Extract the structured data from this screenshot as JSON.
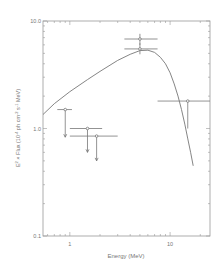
{
  "chart_data": {
    "type": "scatter",
    "title": "",
    "xlabel": "Energy (MeV)",
    "ylabel": "E² × Flux (10⁻⁴ ph cm⁻² s⁻¹ MeV)",
    "ylabel_parts": {
      "pre": "E",
      "sup1": "2",
      "mid": " × Flux (10",
      "sup2": "-4",
      "mid2": " ph cm",
      "sup3": "-2",
      "mid3": " s",
      "sup4": "-1",
      "post": " MeV)"
    },
    "xscale": "log",
    "yscale": "log",
    "xlim": [
      0.54,
      25
    ],
    "ylim": [
      0.1,
      10.0
    ],
    "x_tick_labels": [
      "1",
      "10"
    ],
    "y_tick_labels": [
      "0.1",
      "1.0",
      "10.0"
    ],
    "grid": false,
    "legend": null,
    "series": [
      {
        "name": "measurements",
        "points": [
          {
            "x": 0.9,
            "y": 1.5,
            "xerr": [
              0.75,
              1.05
            ],
            "upper_limit_to": 0.83
          },
          {
            "x": 1.5,
            "y": 1.0,
            "xerr": [
              1.0,
              2.1
            ],
            "upper_limit_to": 0.6
          },
          {
            "x": 1.85,
            "y": 0.85,
            "xerr": [
              1.0,
              3.0
            ],
            "upper_limit_to": 0.5
          },
          {
            "x": 5.0,
            "y": 6.8,
            "xerr": [
              3.5,
              7.5
            ],
            "yerr": [
              6.0,
              7.6
            ]
          },
          {
            "x": 5.0,
            "y": 5.5,
            "xerr": [
              3.5,
              7.5
            ],
            "yerr": [
              4.9,
              6.2
            ]
          },
          {
            "x": 15.0,
            "y": 1.8,
            "xerr": [
              7.5,
              25
            ],
            "yerr": [
              1.0,
              1.8
            ]
          }
        ]
      },
      {
        "name": "model curve",
        "type": "line",
        "x": [
          0.54,
          0.7,
          1.0,
          1.5,
          2.0,
          3.0,
          4.0,
          5.0,
          6.0,
          7.0,
          8.0,
          9.0,
          10.0,
          11.0,
          12.0,
          13.0,
          14.0,
          15.0,
          16.0,
          17.0
        ],
        "y": [
          1.35,
          1.7,
          2.2,
          2.85,
          3.4,
          4.3,
          4.9,
          5.3,
          5.35,
          5.1,
          4.6,
          4.0,
          3.3,
          2.6,
          2.0,
          1.5,
          1.1,
          0.8,
          0.6,
          0.45
        ]
      }
    ]
  }
}
